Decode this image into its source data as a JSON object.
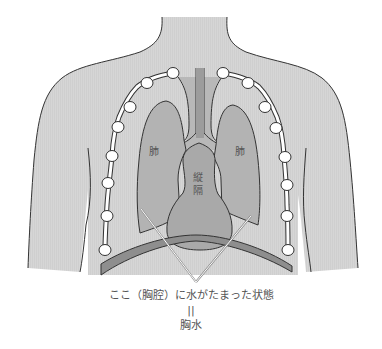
{
  "figure": {
    "labels": {
      "left_lung": "肺",
      "right_lung": "肺",
      "mediastinum_line1": "縦",
      "mediastinum_line2": "隔"
    },
    "caption": {
      "line1": "ここ（胸腔）に水がたまった状態",
      "equals": "||",
      "line2": "胸水"
    }
  },
  "colors": {
    "body": "#d6d6d6",
    "lung": "#b3b3b3",
    "mediastinum": "#a9a9a9",
    "diaphragm": "#8e8e8e",
    "outline": "#333333",
    "rib_bead": "#ffffff",
    "pointer_line": "#ffffff"
  }
}
